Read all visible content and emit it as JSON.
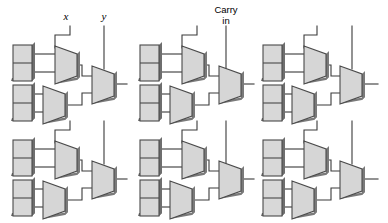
{
  "figure": {
    "title": "",
    "background_color": "#ffffff",
    "width": 388,
    "height": 223,
    "labels": [
      {
        "name": "x",
        "text": "x",
        "x": 66,
        "y": 20,
        "style": "italic"
      },
      {
        "name": "y",
        "text": "y",
        "x": 104,
        "y": 20,
        "style": "italic"
      },
      {
        "name": "carry-in-line1",
        "text": "Carry",
        "x": 226,
        "y": 13,
        "style": "regular"
      },
      {
        "name": "carry-in-line2",
        "text": "in",
        "x": 226,
        "y": 24,
        "style": "regular"
      }
    ],
    "colors": {
      "wire": "#3a3a3a",
      "box_fill": "#d8d8d8",
      "box_stroke": "#4a4a4a",
      "mux_fill": "#d6d6d6",
      "mux_stroke": "#4a4a4a",
      "shadow": "#7a7a7a",
      "text": "#000000"
    },
    "grid": {
      "columns": 3,
      "rows": 2,
      "column_origins_x": [
        0,
        127,
        254
      ],
      "row_origins_y": [
        0,
        95
      ]
    },
    "cell": {
      "name": "logic-cell",
      "description": "register-pair feeding two multiplexers into an output multiplexer",
      "components": [
        {
          "name": "register-box-upper",
          "type": "two-cell-box",
          "x": 13,
          "y": 45,
          "w": 19,
          "h": 36
        },
        {
          "name": "register-box-lower",
          "type": "two-cell-box",
          "x": 13,
          "y": 85,
          "w": 19,
          "h": 36
        },
        {
          "name": "mux-upper",
          "type": "trapezoid",
          "x": 55,
          "y": 46,
          "w": 22,
          "h": 38
        },
        {
          "name": "mux-lower",
          "type": "trapezoid",
          "x": 43,
          "y": 86,
          "w": 22,
          "h": 38
        },
        {
          "name": "mux-output",
          "type": "trapezoid",
          "x": 92,
          "y": 66,
          "w": 21,
          "h": 36
        }
      ],
      "control_lines": [
        {
          "name": "x-control-line",
          "from_x": 70,
          "from_y": 26,
          "to_x": 55,
          "to_y": 46
        },
        {
          "name": "y-control-line",
          "from_x": 104,
          "from_y": 26,
          "to_x": 104,
          "to_y": 66
        }
      ]
    }
  }
}
